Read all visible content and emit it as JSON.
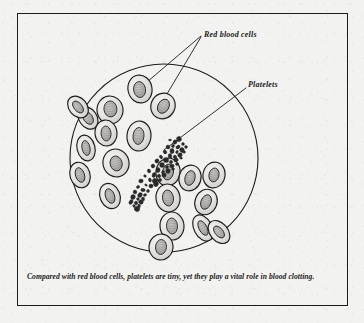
{
  "figure": {
    "title_alt": "Red blood cells and platelets viewed through a microscope",
    "caption": "Compared with red blood cells, platelets are tiny, yet they play a vital role in blood clotting.",
    "background_color": "#f2f2f0",
    "ink_color": "#1c1c1c",
    "cell_fill_color": "#e8e7e4",
    "cell_shade_color": "#b9b7b3",
    "platelet_color": "#2a2a2a"
  },
  "labels": {
    "red_blood_cells": "Red blood cells",
    "platelets": "Platelets"
  },
  "microscope_field": {
    "center_x": 164,
    "center_y": 158,
    "radius": 94
  },
  "leader_lines": [
    {
      "name": "red-blood-cells-leader-1",
      "x1": 201,
      "y1": 36,
      "x2": 140,
      "y2": 88
    },
    {
      "name": "red-blood-cells-leader-2",
      "x1": 201,
      "y1": 37,
      "x2": 161,
      "y2": 104
    },
    {
      "name": "platelets-leader",
      "x1": 246,
      "y1": 88,
      "x2": 164,
      "y2": 150
    }
  ],
  "red_blood_cells": [
    {
      "cx": 140,
      "cy": 89,
      "rx": 12,
      "ry": 14,
      "rot": -12,
      "irx": 6.0,
      "iry": 8.0,
      "irot": -8,
      "ox": -0.5,
      "oy": 0.5
    },
    {
      "cx": 163,
      "cy": 106,
      "rx": 12,
      "ry": 13,
      "rot": 28,
      "irx": 5.5,
      "iry": 7.5,
      "irot": 30,
      "ox": 0.5,
      "oy": 0.0
    },
    {
      "cx": 110,
      "cy": 110,
      "rx": 13,
      "ry": 14,
      "rot": -8,
      "irx": 6.5,
      "iry": 8.0,
      "irot": -5,
      "ox": 0.5,
      "oy": -1.0
    },
    {
      "cx": 88,
      "cy": 118,
      "rx": 9,
      "ry": 12,
      "rot": -34,
      "irx": 4.5,
      "iry": 7.0,
      "irot": -34,
      "ox": 0.0,
      "oy": 0.0
    },
    {
      "cx": 106,
      "cy": 133,
      "rx": 11,
      "ry": 13,
      "rot": -6,
      "irx": 5.0,
      "iry": 7.5,
      "irot": -4,
      "ox": 0.0,
      "oy": 0.5
    },
    {
      "cx": 86,
      "cy": 148,
      "rx": 9,
      "ry": 13,
      "rot": -14,
      "irx": 4.0,
      "iry": 7.5,
      "irot": -12,
      "ox": 0.0,
      "oy": 0.0
    },
    {
      "cx": 139,
      "cy": 136,
      "rx": 12,
      "ry": 15,
      "rot": 5,
      "irx": 5.5,
      "iry": 8.5,
      "irot": 6,
      "ox": -0.5,
      "oy": 0.0
    },
    {
      "cx": 116,
      "cy": 163,
      "rx": 13,
      "ry": 14,
      "rot": -16,
      "irx": 6.0,
      "iry": 7.5,
      "irot": -14,
      "ox": 0.0,
      "oy": 0.5
    },
    {
      "cx": 110,
      "cy": 196,
      "rx": 10,
      "ry": 13,
      "rx2": 0,
      "ry2": 0,
      "rot": -22,
      "irx": 4.5,
      "iry": 7.5,
      "irot": -20,
      "ox": 0.0,
      "oy": 0.0
    },
    {
      "cx": 168,
      "cy": 172,
      "rx": 12,
      "ry": 14,
      "rot": 10,
      "irx": 5.5,
      "iry": 8.0,
      "irot": 10,
      "ox": 0.0,
      "oy": 0.0
    },
    {
      "cx": 190,
      "cy": 178,
      "rx": 11,
      "ry": 13,
      "rot": 16,
      "irx": 5.0,
      "iry": 7.5,
      "irot": 16,
      "ox": 0.0,
      "oy": 0.0
    },
    {
      "cx": 214,
      "cy": 175,
      "rx": 11,
      "ry": 13,
      "rot": 12,
      "irx": 5.0,
      "iry": 7.0,
      "irot": 12,
      "ox": 0.0,
      "oy": 0.0
    },
    {
      "cx": 168,
      "cy": 198,
      "rx": 12,
      "ry": 14,
      "rot": -10,
      "irx": 5.5,
      "iry": 8.0,
      "irot": -8,
      "ox": 0.0,
      "oy": 0.0
    },
    {
      "cx": 206,
      "cy": 202,
      "rx": 11,
      "ry": 13,
      "rot": 22,
      "irx": 5.0,
      "iry": 7.5,
      "irot": 22,
      "ox": 0.0,
      "oy": 0.0
    },
    {
      "cx": 172,
      "cy": 226,
      "rx": 12,
      "ry": 14,
      "rot": -4,
      "irx": 5.5,
      "iry": 8.0,
      "irot": -4,
      "ox": 0.0,
      "oy": 0.0
    },
    {
      "cx": 203,
      "cy": 228,
      "rx": 9,
      "ry": 14,
      "rot": -28,
      "irx": 4.0,
      "iry": 8.0,
      "irot": -28,
      "ox": 0.0,
      "oy": 0.0
    },
    {
      "cx": 219,
      "cy": 232,
      "rx": 9,
      "ry": 13,
      "rot": -40,
      "irx": 4.0,
      "iry": 7.0,
      "irot": -40,
      "ox": 0.0,
      "oy": 0.0
    },
    {
      "cx": 161,
      "cy": 247,
      "rx": 12,
      "ry": 13,
      "rot": 6,
      "irx": 5.5,
      "iry": 7.5,
      "irot": 6,
      "ox": 0.0,
      "oy": 0.0
    },
    {
      "cx": 80,
      "cy": 175,
      "rx": 10,
      "ry": 13,
      "rot": -18,
      "irx": 4.5,
      "iry": 7.5,
      "irot": -18,
      "ox": 0.0,
      "oy": 0.0
    },
    {
      "cx": 78,
      "cy": 107,
      "rx": 9,
      "ry": 12,
      "rot": -40,
      "irx": 4.0,
      "iry": 7.0,
      "irot": -40,
      "ox": 0.0,
      "oy": 0.0
    }
  ],
  "platelet_cluster": {
    "description": "diagonal chain of small dark irregular platelet granules",
    "count": 58,
    "points": [
      [
        170,
        140
      ],
      [
        175,
        142
      ],
      [
        179,
        139
      ],
      [
        173,
        146
      ],
      [
        178,
        147
      ],
      [
        183,
        144
      ],
      [
        168,
        147
      ],
      [
        172,
        151
      ],
      [
        177,
        152
      ],
      [
        182,
        150
      ],
      [
        186,
        147
      ],
      [
        165,
        152
      ],
      [
        170,
        156
      ],
      [
        175,
        157
      ],
      [
        180,
        155
      ],
      [
        184,
        152
      ],
      [
        161,
        157
      ],
      [
        166,
        160
      ],
      [
        171,
        162
      ],
      [
        176,
        160
      ],
      [
        181,
        158
      ],
      [
        157,
        161
      ],
      [
        162,
        165
      ],
      [
        167,
        167
      ],
      [
        172,
        166
      ],
      [
        177,
        164
      ],
      [
        153,
        166
      ],
      [
        158,
        170
      ],
      [
        163,
        172
      ],
      [
        168,
        171
      ],
      [
        173,
        169
      ],
      [
        149,
        171
      ],
      [
        154,
        175
      ],
      [
        159,
        176
      ],
      [
        164,
        175
      ],
      [
        145,
        176
      ],
      [
        150,
        180
      ],
      [
        155,
        181
      ],
      [
        160,
        180
      ],
      [
        141,
        181
      ],
      [
        146,
        185
      ],
      [
        151,
        186
      ],
      [
        156,
        184
      ],
      [
        138,
        187
      ],
      [
        143,
        190
      ],
      [
        148,
        191
      ],
      [
        135,
        192
      ],
      [
        140,
        195
      ],
      [
        145,
        195
      ],
      [
        133,
        197
      ],
      [
        138,
        199
      ],
      [
        143,
        199
      ],
      [
        131,
        202
      ],
      [
        136,
        203
      ],
      [
        141,
        202
      ],
      [
        134,
        206
      ],
      [
        139,
        206
      ],
      [
        137,
        209
      ]
    ]
  }
}
